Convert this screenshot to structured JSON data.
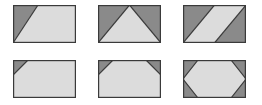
{
  "figure": {
    "title": "",
    "background_color": "#ffffff",
    "width": 262,
    "height": 105,
    "rows": 2,
    "columns": 3,
    "palette": {
      "dark_fill": "#8a8a8a",
      "light_fill": "#dcdcdc",
      "outline": "#3a3a3a",
      "background": "#ffffff"
    },
    "cell_size": {
      "width": 63,
      "height": 38
    },
    "shapes": [
      {
        "id": "shape-1",
        "name": "diagonal-split-rectangle",
        "label": "",
        "position": {
          "x": 13,
          "y": 5
        },
        "size": {
          "width": 63,
          "height": 38
        },
        "regions": [
          {
            "name": "dark-lower-left-triangle",
            "fill": "#8a8a8a",
            "points": "0,0 25,0 0,38"
          },
          {
            "name": "light-upper-right-region",
            "fill": "#dcdcdc",
            "points": "25,0 63,0 63,38 0,38"
          }
        ],
        "edges": [
          {
            "name": "diagonal-edge",
            "points": "25,0 0,38"
          }
        ]
      },
      {
        "id": "shape-2",
        "name": "upward-triangle-rectangle",
        "label": "",
        "position": {
          "x": 98,
          "y": 5
        },
        "size": {
          "width": 63,
          "height": 38
        },
        "regions": [
          {
            "name": "dark-top-left-triangle",
            "fill": "#8a8a8a",
            "points": "0,0 31.5,0 0,38"
          },
          {
            "name": "dark-top-right-triangle",
            "fill": "#8a8a8a",
            "points": "31.5,0 63,0 63,38"
          },
          {
            "name": "light-center-triangle",
            "fill": "#dcdcdc",
            "points": "31.5,0 63,38 0,38"
          }
        ],
        "edges": [
          {
            "name": "left-slope-edge",
            "points": "0,38 31.5,0"
          },
          {
            "name": "right-slope-edge",
            "points": "31.5,0 63,38"
          }
        ]
      },
      {
        "id": "shape-3",
        "name": "diagonal-band-rectangle",
        "label": "",
        "position": {
          "x": 183,
          "y": 5
        },
        "size": {
          "width": 63,
          "height": 38
        },
        "regions": [
          {
            "name": "dark-top-left-triangle",
            "fill": "#8a8a8a",
            "points": "0,0 31.5,0 0,38"
          },
          {
            "name": "dark-bottom-right-triangle",
            "fill": "#8a8a8a",
            "points": "63,0 63,38 31.5,38"
          },
          {
            "name": "light-diagonal-band",
            "fill": "#dcdcdc",
            "points": "31.5,0 63,0 31.5,38 0,38"
          }
        ],
        "edges": [
          {
            "name": "upper-band-edge",
            "points": "31.5,0 0,38"
          },
          {
            "name": "lower-band-edge",
            "points": "63,0 31.5,38"
          }
        ]
      },
      {
        "id": "shape-4",
        "name": "single-corner-cut-rectangle",
        "label": "",
        "position": {
          "x": 13,
          "y": 60
        },
        "size": {
          "width": 63,
          "height": 38
        },
        "regions": [
          {
            "name": "dark-top-left-corner-triangle",
            "fill": "#8a8a8a",
            "points": "0,0 15,0 0,15"
          },
          {
            "name": "light-main-region",
            "fill": "#dcdcdc",
            "points": "15,0 63,0 63,38 0,38 0,15"
          }
        ],
        "edges": [
          {
            "name": "corner-cut-edge",
            "points": "15,0 0,15"
          }
        ]
      },
      {
        "id": "shape-5",
        "name": "two-corner-cut-rectangle",
        "label": "",
        "position": {
          "x": 98,
          "y": 60
        },
        "size": {
          "width": 63,
          "height": 38
        },
        "regions": [
          {
            "name": "dark-top-left-corner-triangle",
            "fill": "#8a8a8a",
            "points": "0,0 15,0 0,15"
          },
          {
            "name": "dark-top-right-corner-triangle",
            "fill": "#8a8a8a",
            "points": "48,0 63,0 63,15"
          },
          {
            "name": "light-trapezoid-region",
            "fill": "#dcdcdc",
            "points": "15,0 48,0 63,15 63,38 0,38 0,15"
          }
        ],
        "edges": [
          {
            "name": "left-corner-cut-edge",
            "points": "15,0 0,15"
          },
          {
            "name": "right-corner-cut-edge",
            "points": "48,0 63,15"
          }
        ]
      },
      {
        "id": "shape-6",
        "name": "hexagon-in-rectangle",
        "label": "",
        "position": {
          "x": 183,
          "y": 60
        },
        "size": {
          "width": 63,
          "height": 38
        },
        "regions": [
          {
            "name": "dark-top-left-corner-triangle",
            "fill": "#8a8a8a",
            "points": "0,0 15,0 0,19"
          },
          {
            "name": "dark-top-right-corner-triangle",
            "fill": "#8a8a8a",
            "points": "48,0 63,0 63,19"
          },
          {
            "name": "dark-bottom-left-corner-triangle",
            "fill": "#8a8a8a",
            "points": "0,19 15,38 0,38"
          },
          {
            "name": "dark-bottom-right-corner-triangle",
            "fill": "#8a8a8a",
            "points": "63,19 63,38 48,38"
          },
          {
            "name": "light-hexagon-region",
            "fill": "#dcdcdc",
            "points": "15,0 48,0 63,19 48,38 15,38 0,19"
          }
        ],
        "edges": [
          {
            "name": "hexagon-outline",
            "points": "15,0 48,0 63,19 48,38 15,38 0,19 15,0"
          }
        ]
      }
    ]
  }
}
